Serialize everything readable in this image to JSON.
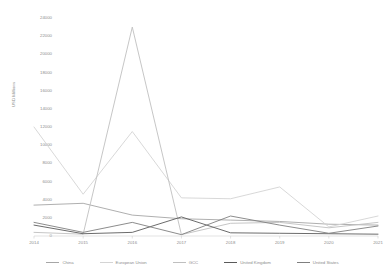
{
  "chart_data": {
    "type": "line",
    "title": "",
    "xlabel": "",
    "ylabel": "USD Millions",
    "categories": [
      "2014",
      "2015",
      "2016",
      "2017",
      "2018",
      "2019",
      "2020",
      "2021"
    ],
    "ylim": [
      0,
      24000
    ],
    "ytick_values": [
      0,
      2000,
      4000,
      6000,
      8000,
      10000,
      12000,
      14000,
      16000,
      18000,
      20000,
      22000,
      24000
    ],
    "ytick_labels": [
      "0",
      "2000",
      "4000",
      "6000",
      "8000",
      "10000",
      "12000",
      "14000",
      "16000",
      "18000",
      "20000",
      "22000",
      "24000"
    ],
    "grid": false,
    "legend_position": "bottom",
    "series": [
      {
        "name": "China",
        "color": "#a6a6a6",
        "values": [
          3400,
          3600,
          2300,
          1900,
          1750,
          1600,
          1300,
          1200
        ]
      },
      {
        "name": "European Union",
        "color": "#d4d4d4",
        "values": [
          12000,
          4600,
          11500,
          4200,
          4100,
          5400,
          1000,
          2200
        ]
      },
      {
        "name": "GCC",
        "color": "#bfbfbf",
        "values": [
          400,
          200,
          23000,
          150,
          1400,
          1500,
          900,
          1500
        ]
      },
      {
        "name": "United Kingdom",
        "color": "#5a5a5a",
        "values": [
          1200,
          250,
          400,
          2100,
          350,
          300,
          250,
          200
        ]
      },
      {
        "name": "United States",
        "color": "#7f7f7f",
        "values": [
          1500,
          400,
          1500,
          150,
          2200,
          1200,
          300,
          1100
        ]
      }
    ]
  }
}
